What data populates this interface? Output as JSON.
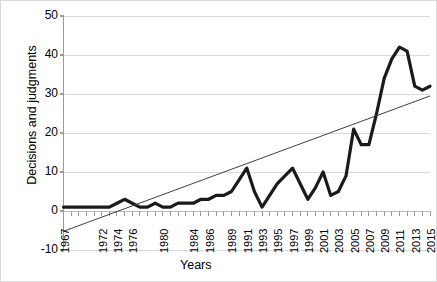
{
  "chart_data": {
    "type": "line",
    "title": "",
    "xlabel": "Years",
    "ylabel": "Decisions and judgments",
    "ylim": [
      -10,
      50
    ],
    "yticks": [
      -10,
      0,
      10,
      20,
      30,
      40,
      50
    ],
    "ytick_labels": [
      "-10",
      "0",
      "10",
      "20",
      "30",
      "40",
      "50"
    ],
    "grid": true,
    "legend": "none",
    "x": [
      1967,
      1968,
      1969,
      1970,
      1971,
      1972,
      1973,
      1974,
      1975,
      1976,
      1977,
      1978,
      1979,
      1980,
      1981,
      1982,
      1983,
      1984,
      1985,
      1986,
      1987,
      1988,
      1989,
      1990,
      1991,
      1992,
      1993,
      1994,
      1995,
      1996,
      1997,
      1998,
      1999,
      2000,
      2001,
      2002,
      2003,
      2004,
      2005,
      2006,
      2007,
      2008,
      2009,
      2010,
      2011,
      2012,
      2013,
      2014,
      2015
    ],
    "xtick_labels": [
      "1967",
      "",
      "",
      "",
      "",
      "1972",
      "",
      "1974",
      "",
      "1976",
      "",
      "",
      "",
      "1980",
      "",
      "",
      "",
      "1984",
      "",
      "1986",
      "",
      "",
      "1989",
      "",
      "1991",
      "",
      "1993",
      "",
      "1995",
      "",
      "1997",
      "",
      "1999",
      "",
      "2001",
      "",
      "2003",
      "",
      "2005",
      "",
      "2007",
      "",
      "2009",
      "",
      "2011",
      "",
      "2013",
      "",
      "2015"
    ],
    "xtick_labels_shown": [
      "1967",
      "1972",
      "1974",
      "1976",
      "1980",
      "1984",
      "1986",
      "1989",
      "1991",
      "1993",
      "1995",
      "1997",
      "1999",
      "2001",
      "2003",
      "2005",
      "2007",
      "2009",
      "2011",
      "2013",
      "2015"
    ],
    "series": [
      {
        "name": "Decisions and judgments",
        "type": "line",
        "color": "#1a1a1a",
        "width": 3.2,
        "values": [
          1,
          1,
          1,
          1,
          1,
          1,
          1,
          2,
          3,
          2,
          1,
          1,
          2,
          1,
          1,
          2,
          2,
          2,
          3,
          3,
          4,
          4,
          5,
          8,
          11,
          5,
          1,
          4,
          7,
          9,
          11,
          7,
          3,
          6,
          10,
          4,
          5,
          9,
          21,
          17,
          17,
          25,
          34,
          39,
          42,
          41,
          32,
          31,
          32
        ]
      },
      {
        "name": "Linear trendline",
        "type": "line",
        "color": "#404040",
        "width": 1,
        "x_endpoints": [
          1967,
          2015
        ],
        "y_endpoints": [
          -5.2,
          29.5
        ]
      }
    ]
  }
}
